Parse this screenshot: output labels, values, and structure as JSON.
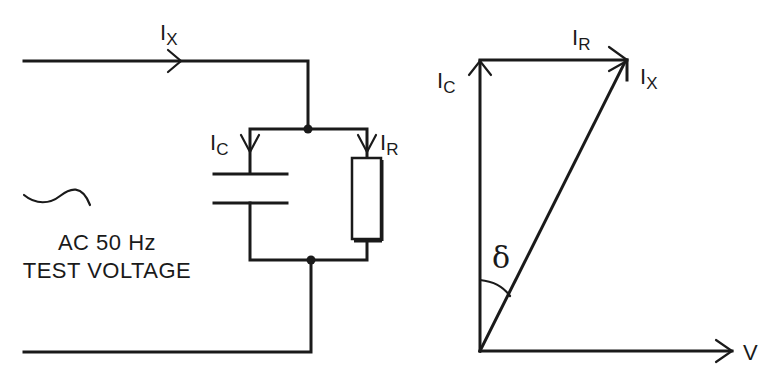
{
  "circuit": {
    "source_label_line1": "AC 50 Hz",
    "source_label_line2": "TEST VOLTAGE",
    "source_icon": "sine-wave-icon",
    "total_current": {
      "main": "I",
      "sub": "X"
    },
    "capacitor_current": {
      "main": "I",
      "sub": "C"
    },
    "resistor_current": {
      "main": "I",
      "sub": "R"
    }
  },
  "phasor": {
    "ic": {
      "main": "I",
      "sub": "C"
    },
    "ir": {
      "main": "I",
      "sub": "R"
    },
    "ix": {
      "main": "I",
      "sub": "X"
    },
    "v": "V",
    "angle": "δ"
  },
  "colors": {
    "ink": "#1a1a1a",
    "background": "#ffffff"
  }
}
